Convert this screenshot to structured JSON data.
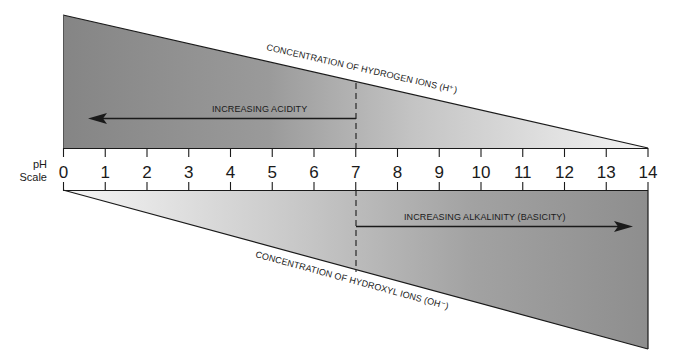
{
  "chart_data": {
    "type": "diagram",
    "title": "pH Scale",
    "scale_label_line1": "pH",
    "scale_label_line2": "Scale",
    "ticks": [
      "0",
      "1",
      "2",
      "3",
      "4",
      "5",
      "6",
      "7",
      "8",
      "9",
      "10",
      "11",
      "12",
      "13",
      "14"
    ],
    "neutral_point": 7,
    "top_wedge": {
      "label": "CONCENTRATION OF HYDROGEN IONS (H⁺)",
      "arrow_label": "INCREASING ACIDITY",
      "direction": "toward 0",
      "high_at": 0,
      "low_at": 14
    },
    "bottom_wedge": {
      "label": "CONCENTRATION OF HYDROXYL IONS (OH⁻)",
      "arrow_label": "INCREASING ALKALINITY (BASICITY)",
      "direction": "toward 14",
      "high_at": 14,
      "low_at": 0
    },
    "colors": {
      "dark_fill": "#8c8c8c",
      "light_fill": "#f2f2f2",
      "line": "#1a1a1a"
    }
  }
}
